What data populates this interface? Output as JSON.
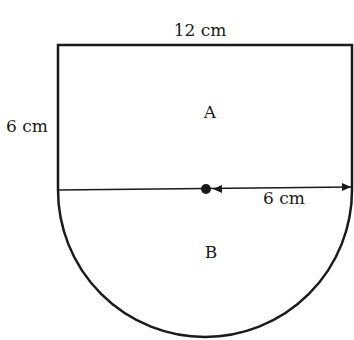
{
  "diagram": {
    "type": "composite shape: rectangle on top of semicircle",
    "labels": {
      "top_width": "12 cm",
      "left_height": "6 cm",
      "radius": "6 cm",
      "region_top": "A",
      "region_bottom": "B"
    },
    "colors": {
      "stroke": "#1a1a1a",
      "background": "#ffffff"
    }
  }
}
